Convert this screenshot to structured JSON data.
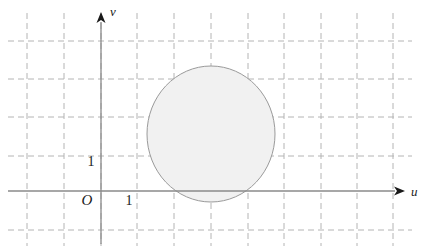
{
  "figure": {
    "type": "coordinate-plane-diagram",
    "width": 431,
    "height": 251,
    "background_color": "#ffffff"
  },
  "axes": {
    "horizontal": {
      "name": "u-axis",
      "label": "u",
      "color": "#8a8a8a",
      "y_pixel": 191,
      "x_start_pixel": 8,
      "x_end_pixel": 405,
      "arrow": "right"
    },
    "vertical": {
      "name": "v-axis",
      "label": "v",
      "color": "#8a8a8a",
      "x_pixel": 101,
      "y_start_pixel": 244,
      "y_end_pixel": 12,
      "arrow": "up"
    },
    "origin_label": "O"
  },
  "ticks": {
    "u_unit_label": "1",
    "v_unit_label": "1",
    "unit_pixels_x": 36.6,
    "unit_pixels_y": 38.3
  },
  "grid": {
    "style": "dashed",
    "color": "#b4b4b4",
    "dash_pattern": "6 4",
    "vertical_lines_x": [
      27,
      64,
      101,
      137,
      174,
      211,
      248,
      284,
      321,
      357,
      393
    ],
    "horizontal_lines_y": [
      41,
      79,
      117,
      156,
      191,
      230
    ],
    "x_extent": [
      8,
      412
    ],
    "y_extent": [
      13,
      246
    ]
  },
  "chart_data": {
    "type": "scatter",
    "title": "",
    "xlabel": "u",
    "ylabel": "v",
    "grid": true,
    "legend_position": "none",
    "shapes": [
      {
        "kind": "circle",
        "name": "shaded-disk",
        "center_units": [
          3.0,
          1.5
        ],
        "radius_units": 1.75,
        "center_pixels": [
          211,
          134
        ],
        "radius_x_pixels": 64,
        "radius_y_pixels": 68,
        "fill_color": "#f1f1f1",
        "stroke_color": "#9a9a9a",
        "stroke_width": 1
      }
    ],
    "annotations": [
      {
        "text": "O",
        "units": [
          0,
          0
        ]
      },
      {
        "text": "1",
        "units": [
          1,
          0
        ]
      },
      {
        "text": "1",
        "units": [
          0,
          1
        ]
      }
    ]
  }
}
